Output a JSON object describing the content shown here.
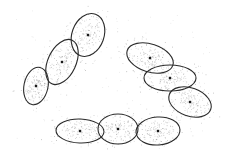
{
  "chart_data": {
    "type": "scatter",
    "title": "",
    "xlabel": "",
    "ylabel": "",
    "grid": false,
    "legend": null,
    "colors": {
      "points": "#9a9a9a",
      "ellipse": "#2b2b2b",
      "center": "#1a1a1a",
      "background": "#ffffff"
    },
    "clusters": [
      {
        "id": 1,
        "cx": 88,
        "cy": 35,
        "rx": 16,
        "ry": 22,
        "angle": 20
      },
      {
        "id": 2,
        "cx": 62,
        "cy": 62,
        "rx": 14,
        "ry": 24,
        "angle": 25
      },
      {
        "id": 3,
        "cx": 36,
        "cy": 86,
        "rx": 12,
        "ry": 19,
        "angle": 12
      },
      {
        "id": 4,
        "cx": 150,
        "cy": 58,
        "rx": 24,
        "ry": 14,
        "angle": 18
      },
      {
        "id": 5,
        "cx": 170,
        "cy": 78,
        "rx": 26,
        "ry": 13,
        "angle": 0
      },
      {
        "id": 6,
        "cx": 190,
        "cy": 102,
        "rx": 22,
        "ry": 14,
        "angle": 20
      },
      {
        "id": 7,
        "cx": 80,
        "cy": 131,
        "rx": 24,
        "ry": 12,
        "angle": 2
      },
      {
        "id": 8,
        "cx": 118,
        "cy": 129,
        "rx": 20,
        "ry": 15,
        "angle": 0
      },
      {
        "id": 9,
        "cx": 158,
        "cy": 131,
        "rx": 22,
        "ry": 14,
        "angle": -4
      }
    ]
  }
}
